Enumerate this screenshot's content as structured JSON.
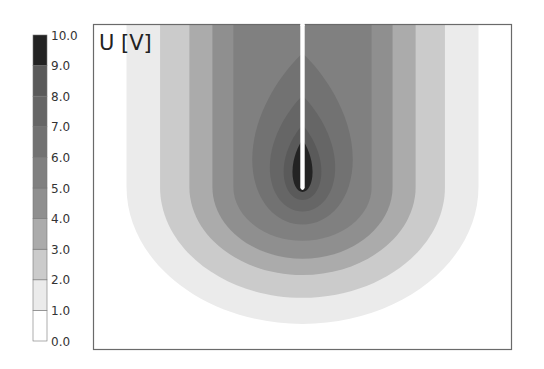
{
  "chart_data": {
    "type": "heatmap",
    "subtype": "filled-contour",
    "title": "U [V]",
    "quantity": "U",
    "unit": "V",
    "xlabel": "",
    "ylabel": "",
    "colorbar": {
      "position": "left",
      "range": [
        0.0,
        10.0
      ],
      "ticks": [
        "0.0",
        "1.0",
        "2.0",
        "3.0",
        "4.0",
        "5.0",
        "6.0",
        "7.0",
        "8.0",
        "9.0",
        "10.0"
      ],
      "levels": [
        {
          "min": 0,
          "max": 1,
          "color": "#ffffff"
        },
        {
          "min": 1,
          "max": 2,
          "color": "#ebebeb"
        },
        {
          "min": 2,
          "max": 3,
          "color": "#cbcbcb"
        },
        {
          "min": 3,
          "max": 4,
          "color": "#ababab"
        },
        {
          "min": 4,
          "max": 5,
          "color": "#8f8f8f"
        },
        {
          "min": 5,
          "max": 6,
          "color": "#808080"
        },
        {
          "min": 6,
          "max": 7,
          "color": "#727272"
        },
        {
          "min": 7,
          "max": 8,
          "color": "#666666"
        },
        {
          "min": 8,
          "max": 9,
          "color": "#5a5a5a"
        },
        {
          "min": 9,
          "max": 10,
          "color": "#232323"
        }
      ]
    },
    "field": {
      "description": "Potential around a thin vertical electrode entering from the top edge; contours are U-shaped and open at the top for low levels, closed teardrops for high levels",
      "electrode": {
        "x_center": 0.5,
        "tip_depth": 0.5,
        "color": "#ffffff"
      },
      "contours": [
        {
          "level": 1,
          "half_width": 0.42,
          "bottom_depth": 0.92,
          "closed_top": false
        },
        {
          "level": 2,
          "half_width": 0.34,
          "bottom_depth": 0.84,
          "closed_top": false
        },
        {
          "level": 3,
          "half_width": 0.27,
          "bottom_depth": 0.77,
          "closed_top": false
        },
        {
          "level": 4,
          "half_width": 0.215,
          "bottom_depth": 0.72,
          "closed_top": false
        },
        {
          "level": 5,
          "half_width": 0.165,
          "bottom_depth": 0.665,
          "closed_top": false
        },
        {
          "level": 6,
          "half_width": 0.12,
          "bottom_depth": 0.615,
          "closed_top": true,
          "top_depth": 0.09
        },
        {
          "level": 7,
          "half_width": 0.078,
          "bottom_depth": 0.575,
          "closed_top": true,
          "top_depth": 0.22
        },
        {
          "level": 8,
          "half_width": 0.045,
          "bottom_depth": 0.54,
          "closed_top": true,
          "top_depth": 0.31
        },
        {
          "level": 9,
          "half_width": 0.024,
          "bottom_depth": 0.515,
          "closed_top": true,
          "top_depth": 0.355
        }
      ]
    },
    "grid": false,
    "legend": "colorbar-left"
  }
}
